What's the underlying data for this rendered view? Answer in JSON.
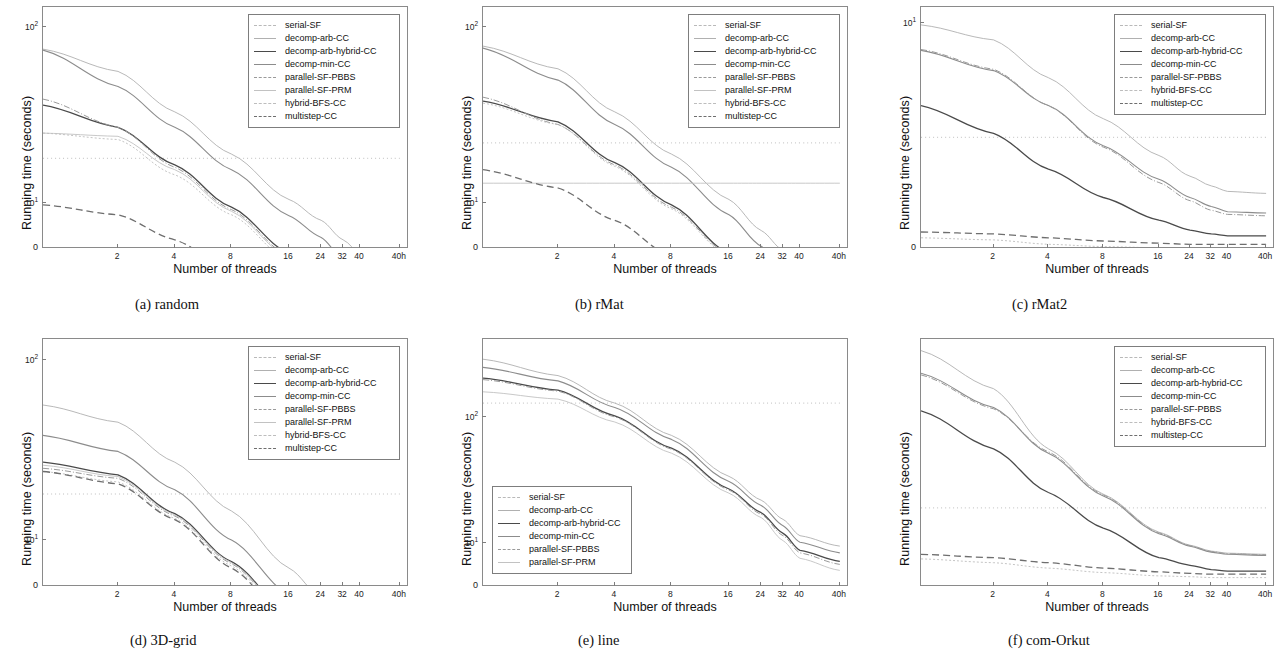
{
  "figure": {
    "axis_titles": {
      "x": "Number of threads",
      "y": "Running time (seconds)"
    },
    "xtick_labels": [
      "2",
      "4",
      "8",
      "16",
      "24",
      "32",
      "40",
      "40h"
    ],
    "xtick_positions": [
      2,
      4,
      8,
      16,
      24,
      32,
      40,
      48
    ],
    "series_styles": {
      "serial-SF": {
        "color": "#b9b9b9",
        "dash": "1,3",
        "width": 0.9
      },
      "decomp-arb-CC": {
        "color": "#b0b0b0",
        "dash": "none",
        "width": 0.9
      },
      "decomp-arb-hybrid-CC": {
        "color": "#4a4a4a",
        "dash": "none",
        "width": 1.3
      },
      "decomp-min-CC": {
        "color": "#8c8c8c",
        "dash": "none",
        "width": 1.1
      },
      "parallel-SF-PBBS": {
        "color": "#9a9a9a",
        "dash": "6,2,1,2",
        "width": 1.0
      },
      "parallel-SF-PRM": {
        "color": "#c2c2c2",
        "dash": "none",
        "width": 0.9
      },
      "hybrid-BFS-CC": {
        "color": "#bdbdbd",
        "dash": "2,2",
        "width": 0.9
      },
      "multistep-CC": {
        "color": "#6e6e6e",
        "dash": "7,4",
        "width": 1.3
      }
    }
  },
  "chart_data": [
    {
      "id": "a",
      "type": "line",
      "caption": "(a) random",
      "title": "random",
      "xlabel": "Number of threads",
      "ylabel": "Running time (seconds)",
      "xscale": "log-threads",
      "yscale": "log",
      "ylim": [
        5.5,
        130
      ],
      "ytick_labels": [
        "10^2",
        "10^1",
        "0"
      ],
      "ytick_values": [
        100,
        10,
        0
      ],
      "legend_position": "upper-right",
      "x": [
        1,
        2,
        4,
        8,
        16,
        24,
        32,
        40,
        48
      ],
      "series": [
        {
          "name": "serial-SF",
          "values": [
            18,
            18,
            18,
            18,
            18,
            18,
            18,
            18,
            18
          ]
        },
        {
          "name": "decomp-arb-CC",
          "values": [
            75,
            56,
            33,
            19,
            10.5,
            8.0,
            6.2,
            5.2,
            4.9
          ]
        },
        {
          "name": "decomp-arb-hybrid-CC",
          "values": [
            36,
            27,
            16.5,
            9.5,
            5.2,
            4.0,
            3.1,
            2.7,
            2.5
          ]
        },
        {
          "name": "decomp-min-CC",
          "values": [
            74,
            46,
            27,
            15.5,
            8.5,
            6.4,
            4.8,
            3.6,
            3.1
          ]
        },
        {
          "name": "parallel-SF-PBBS",
          "values": [
            39,
            27,
            16,
            9.2,
            5.0,
            3.8,
            3.0,
            2.6,
            2.4
          ]
        },
        {
          "name": "parallel-SF-PRM",
          "values": [
            25,
            24,
            15.5,
            9.0,
            4.9,
            3.7,
            2.9,
            2.5,
            2.35
          ]
        },
        {
          "name": "hybrid-BFS-CC",
          "values": [
            25,
            23,
            14.5,
            8.6,
            4.7,
            3.6,
            2.8,
            2.4,
            2.3
          ]
        },
        {
          "name": "multistep-CC",
          "values": [
            9.8,
            8.6,
            6.2,
            4.1,
            2.6,
            2.2,
            2.05,
            2.0,
            2.0
          ]
        }
      ]
    },
    {
      "id": "b",
      "type": "line",
      "caption": "(b) rMat",
      "title": "rMat",
      "xlabel": "Number of threads",
      "ylabel": "Running time (seconds)",
      "xscale": "log-threads",
      "yscale": "log",
      "ylim": [
        5.5,
        130
      ],
      "ytick_labels": [
        "10^2",
        "10^1",
        "0"
      ],
      "ytick_values": [
        100,
        10,
        0
      ],
      "legend_position": "upper-right",
      "x": [
        1,
        2,
        4,
        8,
        16,
        24,
        32,
        40,
        48
      ],
      "series": [
        {
          "name": "serial-SF",
          "values": [
            22,
            22,
            22,
            22,
            22,
            22,
            22,
            22,
            22
          ]
        },
        {
          "name": "decomp-arb-CC",
          "values": [
            78,
            58,
            33,
            19,
            10.5,
            7.0,
            5.4,
            4.6,
            4.2
          ]
        },
        {
          "name": "decomp-arb-hybrid-CC",
          "values": [
            38,
            29,
            17,
            9.8,
            5.2,
            3.7,
            3.0,
            2.7,
            2.6
          ]
        },
        {
          "name": "decomp-min-CC",
          "values": [
            76,
            50,
            28,
            16,
            8.6,
            5.7,
            4.2,
            3.4,
            3.0
          ]
        },
        {
          "name": "parallel-SF-PBBS",
          "values": [
            40,
            28,
            16.5,
            9.5,
            5.1,
            3.6,
            2.9,
            2.65,
            2.55
          ]
        },
        {
          "name": "parallel-SF-PRM",
          "values": [
            13,
            13,
            13,
            13,
            13,
            13,
            13,
            13,
            13
          ]
        },
        {
          "name": "hybrid-BFS-CC",
          "values": [
            37,
            28,
            16.2,
            9.3,
            5.0,
            3.5,
            2.85,
            2.6,
            2.5
          ]
        },
        {
          "name": "multistep-CC",
          "values": [
            15.5,
            12.2,
            8.0,
            5.0,
            3.1,
            2.5,
            2.3,
            2.25,
            2.25
          ]
        }
      ]
    },
    {
      "id": "c",
      "type": "line",
      "caption": "(c) rMat2",
      "title": "rMat2",
      "xlabel": "Number of threads",
      "ylabel": "Running time (seconds)",
      "xscale": "log-threads",
      "yscale": "log",
      "ylim": [
        0.25,
        13
      ],
      "ytick_labels": [
        "10^1",
        "0"
      ],
      "ytick_values": [
        10,
        0
      ],
      "legend_position": "upper-right",
      "x": [
        1,
        2,
        4,
        8,
        16,
        24,
        32,
        40,
        48
      ],
      "series": [
        {
          "name": "serial-SF",
          "values": [
            1.55,
            1.55,
            1.55,
            1.55,
            1.55,
            1.55,
            1.55,
            1.55,
            1.55
          ]
        },
        {
          "name": "decomp-arb-CC",
          "values": [
            9.7,
            7.6,
            4.1,
            2.1,
            1.15,
            0.82,
            0.7,
            0.64,
            0.62
          ]
        },
        {
          "name": "decomp-arb-hybrid-CC",
          "values": [
            2.6,
            1.65,
            0.92,
            0.58,
            0.4,
            0.34,
            0.32,
            0.31,
            0.31
          ]
        },
        {
          "name": "decomp-min-CC",
          "values": [
            6.4,
            4.6,
            2.6,
            1.35,
            0.78,
            0.58,
            0.5,
            0.46,
            0.45
          ]
        },
        {
          "name": "parallel-SF-PBBS",
          "values": [
            6.5,
            4.7,
            2.6,
            1.32,
            0.74,
            0.55,
            0.47,
            0.44,
            0.43
          ]
        },
        {
          "name": "hybrid-BFS-CC",
          "values": [
            0.3,
            0.29,
            0.27,
            0.26,
            0.255,
            0.25,
            0.25,
            0.25,
            0.25
          ]
        },
        {
          "name": "multistep-CC",
          "values": [
            0.33,
            0.32,
            0.3,
            0.285,
            0.275,
            0.27,
            0.27,
            0.27,
            0.27
          ]
        }
      ]
    },
    {
      "id": "d",
      "type": "line",
      "caption": "(d) 3D-grid",
      "title": "3D-grid",
      "xlabel": "Number of threads",
      "ylabel": "Running time (seconds)",
      "xscale": "log-threads",
      "yscale": "log",
      "ylim": [
        5.5,
        130
      ],
      "ytick_labels": [
        "10^2",
        "10^1",
        "0"
      ],
      "ytick_values": [
        100,
        10,
        0
      ],
      "legend_position": "upper-right",
      "x": [
        1,
        2,
        4,
        8,
        16,
        24,
        32,
        40,
        48
      ],
      "series": [
        {
          "name": "serial-SF",
          "values": [
            18,
            18,
            18,
            18,
            18,
            18,
            18,
            18,
            18
          ]
        },
        {
          "name": "decomp-arb-CC",
          "values": [
            56,
            45,
            27,
            14.5,
            7.0,
            4.8,
            3.7,
            3.1,
            2.8
          ]
        },
        {
          "name": "decomp-arb-hybrid-CC",
          "values": [
            27,
            23,
            14.0,
            7.6,
            3.9,
            2.9,
            2.4,
            2.2,
            2.1
          ]
        },
        {
          "name": "decomp-min-CC",
          "values": [
            38,
            31,
            19,
            10.0,
            5.0,
            3.5,
            2.8,
            2.5,
            2.35
          ]
        },
        {
          "name": "parallel-SF-PBBS",
          "values": [
            25,
            22,
            13.6,
            7.4,
            3.8,
            2.8,
            2.35,
            2.15,
            2.05
          ]
        },
        {
          "name": "parallel-SF-PRM",
          "values": [
            26,
            22.5,
            13.8,
            7.5,
            3.85,
            2.85,
            2.4,
            2.2,
            2.1
          ]
        },
        {
          "name": "hybrid-BFS-CC",
          "values": [
            24,
            21,
            13.2,
            7.2,
            3.7,
            2.75,
            2.3,
            2.1,
            2.0
          ]
        },
        {
          "name": "multistep-CC",
          "values": [
            24,
            20.5,
            13.0,
            7.0,
            3.6,
            2.7,
            2.25,
            2.05,
            1.95
          ]
        }
      ]
    },
    {
      "id": "e",
      "type": "line",
      "caption": "(e) line",
      "title": "line",
      "xlabel": "Number of threads",
      "ylabel": "Running time (seconds)",
      "xscale": "log-threads",
      "yscale": "log",
      "ylim": [
        4.5,
        420
      ],
      "ytick_labels": [
        "10^2",
        "10^1",
        "0"
      ],
      "ytick_values": [
        100,
        10,
        0
      ],
      "legend_position": "lower-left",
      "x": [
        1,
        2,
        4,
        8,
        16,
        24,
        32,
        40,
        48
      ],
      "series": [
        {
          "name": "serial-SF",
          "values": [
            130,
            130,
            130,
            130,
            130,
            130,
            130,
            130,
            130
          ]
        },
        {
          "name": "decomp-arb-CC",
          "values": [
            290,
            215,
            130,
            72,
            34,
            22,
            15.5,
            11.5,
            9.5
          ]
        },
        {
          "name": "decomp-arb-hybrid-CC",
          "values": [
            205,
            165,
            103,
            57,
            27,
            17.5,
            12.0,
            8.8,
            7.2
          ]
        },
        {
          "name": "decomp-min-CC",
          "values": [
            250,
            195,
            120,
            67,
            31,
            20,
            13.8,
            10.2,
            8.4
          ]
        },
        {
          "name": "parallel-SF-PBBS",
          "values": [
            200,
            162,
            101,
            56,
            26.5,
            17.0,
            11.5,
            8.4,
            6.8
          ]
        },
        {
          "name": "parallel-SF-PRM",
          "values": [
            160,
            140,
            92,
            52,
            25,
            16.0,
            10.5,
            7.6,
            6.1
          ]
        }
      ]
    },
    {
      "id": "f",
      "type": "line",
      "caption": "(f) com-Orkut",
      "title": "com-Orkut",
      "xlabel": "Number of threads",
      "ylabel": "Running time (seconds)",
      "xscale": "log-threads",
      "yscale": "log",
      "ylim": [
        0.25,
        30
      ],
      "ytick_labels": [],
      "ytick_values": [],
      "legend_position": "upper-right",
      "x": [
        1,
        2,
        4,
        8,
        16,
        24,
        32,
        40,
        48
      ],
      "series": [
        {
          "name": "serial-SF",
          "values": [
            1.15,
            1.15,
            1.15,
            1.15,
            1.15,
            1.15,
            1.15,
            1.15,
            1.15
          ]
        },
        {
          "name": "decomp-arb-CC",
          "values": [
            24,
            11.5,
            3.6,
            1.5,
            0.72,
            0.56,
            0.5,
            0.48,
            0.47
          ]
        },
        {
          "name": "decomp-arb-hybrid-CC",
          "values": [
            7.5,
            3.6,
            1.55,
            0.78,
            0.44,
            0.38,
            0.35,
            0.34,
            0.34
          ]
        },
        {
          "name": "decomp-min-CC",
          "values": [
            15.5,
            8.0,
            3.3,
            1.45,
            0.7,
            0.55,
            0.49,
            0.47,
            0.46
          ]
        },
        {
          "name": "parallel-SF-PBBS",
          "values": [
            15.0,
            7.8,
            3.4,
            1.48,
            0.71,
            0.555,
            0.495,
            0.475,
            0.465
          ]
        },
        {
          "name": "hybrid-BFS-CC",
          "values": [
            0.43,
            0.4,
            0.36,
            0.33,
            0.31,
            0.305,
            0.3,
            0.3,
            0.3
          ]
        },
        {
          "name": "multistep-CC",
          "values": [
            0.47,
            0.44,
            0.4,
            0.36,
            0.335,
            0.325,
            0.32,
            0.32,
            0.32
          ]
        }
      ]
    }
  ]
}
